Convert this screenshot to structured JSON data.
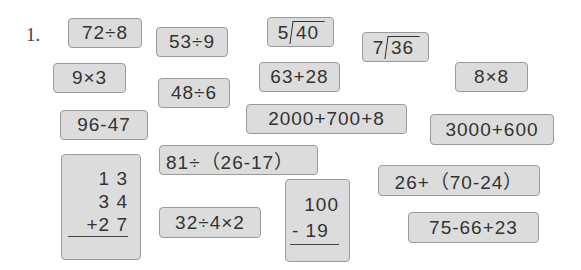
{
  "question_number": "1.",
  "cards": {
    "c1": "72÷8",
    "c2": "53÷9",
    "c3": {
      "divisor": "5",
      "dividend": "40"
    },
    "c4": {
      "divisor": "7",
      "dividend": "36"
    },
    "c5": "9×3",
    "c6": "48÷6",
    "c7": "63+28",
    "c8": "8×8",
    "c9": "96-47",
    "c10": "2000+700+8",
    "c11": "3000+600",
    "c12": "81÷（26-17）",
    "c13": {
      "line1": "1 3",
      "line2": "3 4",
      "line3": "+2 7"
    },
    "c14": {
      "line1": "100",
      "line2": "- 19"
    },
    "c15": "26+（70-24）",
    "c16": "32÷4×2",
    "c17": "75-66+23"
  }
}
